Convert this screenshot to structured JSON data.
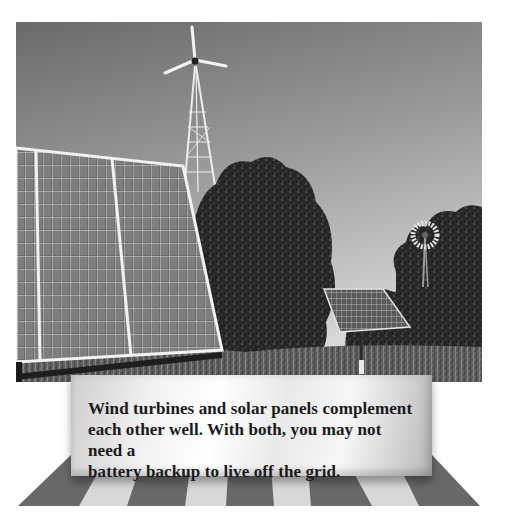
{
  "photo": {
    "description": "Rural scene with a wind turbine on a lattice tower, a large tilted solar panel array in foreground, a deciduous tree, a smaller pole-mounted solar panel, and a farm windmill among trees",
    "colors": {
      "sky_top": "#6e6e6e",
      "sky_bottom": "#d4d4d4",
      "foliage": "#2a2a2a",
      "panel": "#6a6a6a",
      "frame": "#f0f0f0"
    }
  },
  "caption": {
    "lines": [
      "Wind turbines and solar panels complement",
      "each other well. With both, you may not need a",
      "battery backup to live off the grid."
    ]
  },
  "floor": {
    "stripe_dark": "#686868",
    "stripe_light": "#d8d8d8"
  }
}
